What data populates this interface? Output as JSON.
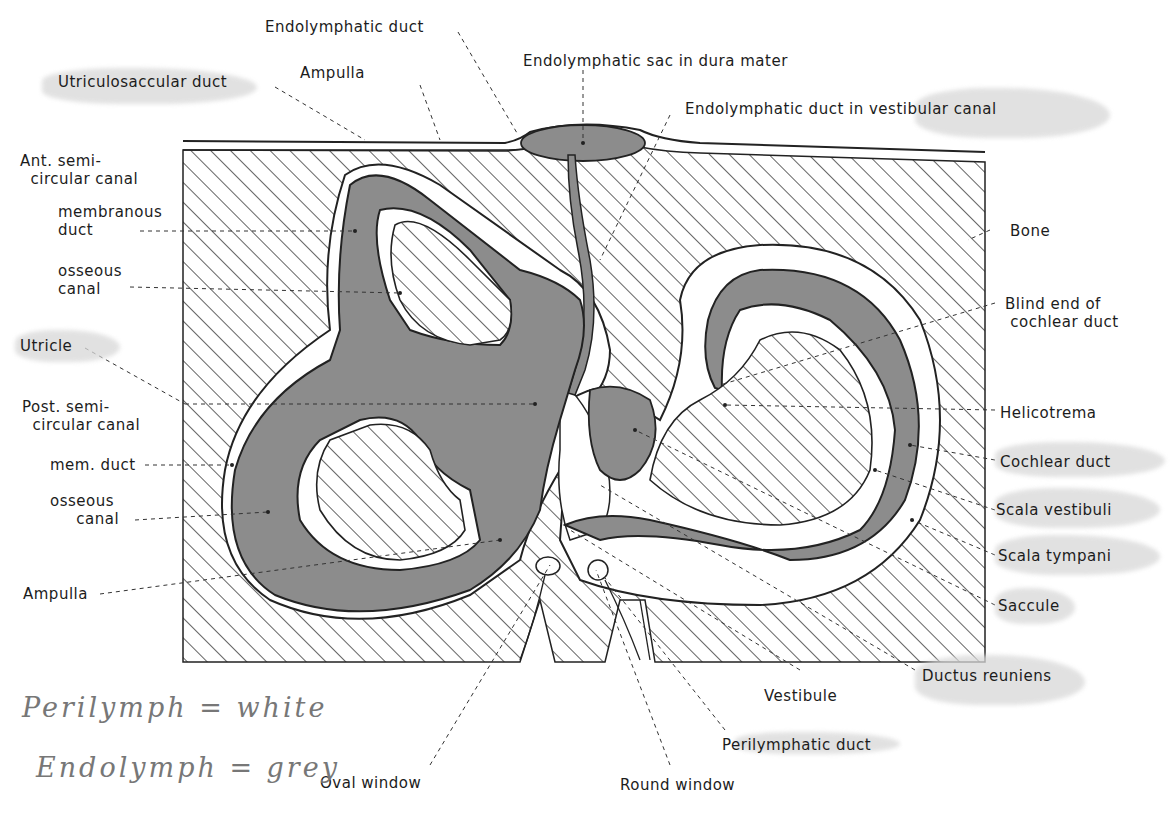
{
  "figure": {
    "colors": {
      "bone_hatch": "#222222",
      "endolymph_grey": "#8a8a8a",
      "perilymph_white": "#ffffff",
      "highlighter": "#d6d6d6",
      "handwriting": "#7a7a7a"
    }
  },
  "labels": {
    "endolymphatic_duct": "Endolymphatic duct",
    "utriculosaccular_duct": "Utriculosaccular duct",
    "ampulla_top": "Ampulla",
    "endolymphatic_sac": "Endolymphatic sac in dura mater",
    "endolymphatic_duct_vestibular": "Endolymphatic duct in vestibular canal",
    "ant_semicircular_canal": "Ant. semi-\n  circular canal",
    "membranous_duct": "membranous\nduct",
    "osseous_canal_top": "osseous\ncanal",
    "utricle": "Utricle",
    "post_semicircular_canal": "Post. semi-\n  circular canal",
    "mem_duct": "mem. duct",
    "osseous_canal_bottom": "osseous\n     canal",
    "ampulla_bottom": "Ampulla",
    "bone": "Bone",
    "blind_end_cochlear_duct": "Blind end of\n cochlear duct",
    "helicotrema": "Helicotrema",
    "cochlear_duct": "Cochlear duct",
    "scala_vestibuli": "Scala vestibuli",
    "scala_tympani": "Scala tympani",
    "saccule": "Saccule",
    "ductus_reuniens": "Ductus reuniens",
    "vestibule": "Vestibule",
    "perilymphatic_duct": "Perilymphatic duct",
    "round_window": "Round window",
    "oval_window": "Oval window"
  },
  "handwritten_note": {
    "line1": "Perilymph = white",
    "line2": "Endolymph = grey"
  },
  "highlighted_labels": [
    "Utriculosaccular duct",
    "Endolymphatic duct in vestibular canal",
    "Utricle",
    "Cochlear duct",
    "Scala vestibuli",
    "Scala tympani",
    "Saccule",
    "Ductus reuniens",
    "Perilymphatic duct"
  ]
}
